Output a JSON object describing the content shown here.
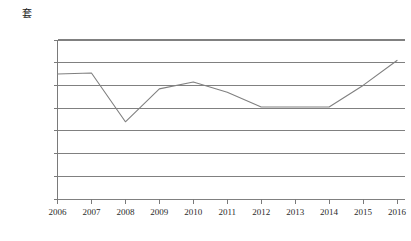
{
  "chart_data": {
    "type": "line",
    "title": "",
    "xlabel": "",
    "ylabel": "套",
    "unit_label": "套",
    "categories": [
      "2006",
      "2007",
      "2008",
      "2009",
      "2010",
      "2011",
      "2012",
      "2013",
      "2014",
      "2015",
      "2016"
    ],
    "values": [
      110000,
      111000,
      68000,
      97000,
      103000,
      94000,
      81000,
      81000,
      81000,
      100000,
      122000
    ],
    "series": [
      {
        "name": "",
        "values": [
          110000,
          111000,
          68000,
          97000,
          103000,
          94000,
          81000,
          81000,
          81000,
          100000,
          122000
        ]
      }
    ],
    "ylim": [
      0,
      140000
    ],
    "ytick_values": [
      0,
      20000,
      40000,
      60000,
      80000,
      100000,
      120000,
      140000
    ],
    "ytick_labels": [
      "0",
      "20 000",
      "40 000",
      "60 000",
      "80 000",
      "100 000",
      "120 000",
      "140 000"
    ],
    "xtick_labels": [
      "2006",
      "2007",
      "2008",
      "2009",
      "2010",
      "2011",
      "2012",
      "2013",
      "2014",
      "2015",
      "2016"
    ],
    "grid": true,
    "grid_axis": "y",
    "legend": false,
    "legend_position": "none",
    "line_color": "#808080",
    "grid_color": "#808080",
    "axis_color": "#7a7a7a",
    "background_color": "#ffffff"
  }
}
